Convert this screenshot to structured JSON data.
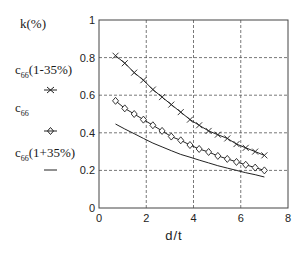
{
  "chart_data": {
    "type": "line",
    "title": "",
    "xlabel": "d/t",
    "ylabel": "k(%)",
    "xlim": [
      0,
      8
    ],
    "ylim": [
      0,
      1
    ],
    "x_ticks": [
      "0",
      "2",
      "4",
      "6",
      "8"
    ],
    "y_ticks": [
      "0",
      "0.2",
      "0.4",
      "0.6",
      "0.8",
      "1"
    ],
    "grid": true,
    "grid_style": "dashed",
    "legend_position": "left, outside plot",
    "x": [
      0.7,
      1.09,
      1.49,
      1.88,
      2.28,
      2.67,
      3.06,
      3.46,
      3.85,
      4.24,
      4.64,
      5.03,
      5.43,
      5.82,
      6.21,
      6.61,
      7.0
    ],
    "series": [
      {
        "name": "c66(1-35%)",
        "marker": "x",
        "values": [
          0.81,
          0.77,
          0.72,
          0.68,
          0.63,
          0.59,
          0.55,
          0.51,
          0.47,
          0.44,
          0.41,
          0.39,
          0.37,
          0.34,
          0.32,
          0.3,
          0.28
        ]
      },
      {
        "name": "c66",
        "marker": "diamond",
        "values": [
          0.57,
          0.53,
          0.5,
          0.47,
          0.44,
          0.41,
          0.38,
          0.36,
          0.335,
          0.314,
          0.298,
          0.277,
          0.261,
          0.245,
          0.23,
          0.215,
          0.2
        ]
      },
      {
        "name": "c66(1+35%)",
        "marker": "none",
        "values": [
          0.447,
          0.42,
          0.395,
          0.37,
          0.345,
          0.325,
          0.305,
          0.285,
          0.27,
          0.255,
          0.24,
          0.225,
          0.212,
          0.2,
          0.188,
          0.177,
          0.165
        ]
      }
    ]
  },
  "legend": {
    "title": "k(%)",
    "items": [
      {
        "base": "c",
        "sub": "66",
        "suffix": "(1-35%)",
        "marker": "x-marker"
      },
      {
        "base": "c",
        "sub": "66",
        "suffix": "",
        "marker": "diamond-marker"
      },
      {
        "base": "c",
        "sub": "66",
        "suffix": "(1+35%)",
        "marker": "line-marker"
      }
    ]
  }
}
